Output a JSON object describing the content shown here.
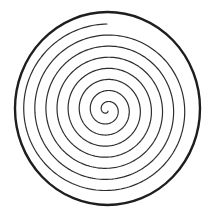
{
  "figure": {
    "type": "archimedean-spiral-in-circle",
    "background": "#ffffff",
    "outer_circle": {
      "cx": 107.5,
      "cy": 108.5,
      "rx": 92.5,
      "ry": 96.5,
      "stroke": "#1e1e1e",
      "stroke_width": 2.4
    },
    "spiral": {
      "cx": 107,
      "cy": 110,
      "turns_spacing_px": 11.1,
      "end_angle_deg": 270,
      "full_turns": 7,
      "start_radius": 1.5,
      "stroke": "#2e2e2e",
      "stroke_width": 1.2
    }
  }
}
